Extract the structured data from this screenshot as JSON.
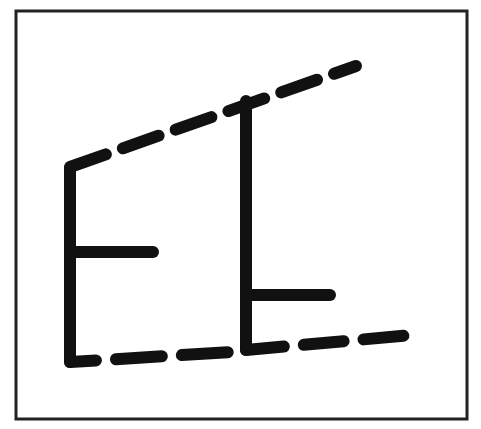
{
  "figure": {
    "colors": {
      "background": "#ffffff",
      "stroke": "#111111",
      "frame": "#222222"
    },
    "frame": {
      "x": 16,
      "y": 11,
      "width": 451,
      "height": 408,
      "stroke_width": 3
    },
    "stroke_width": 12,
    "dash_pattern": "38 18",
    "shapes": {
      "top_dashed_line": {
        "x1": 70,
        "y1": 167,
        "x2": 356,
        "y2": 66
      },
      "left_e": {
        "vertical": {
          "x": 70,
          "y1": 170,
          "y2": 362
        },
        "middle_bar": {
          "x1": 70,
          "x2": 153,
          "y": 252
        },
        "bottom_dashed": {
          "x1": 70,
          "y1": 362,
          "x2": 232,
          "y2": 352
        }
      },
      "right_e": {
        "vertical": {
          "x": 246,
          "y1": 100,
          "y2": 350
        },
        "middle_bar": {
          "x1": 246,
          "x2": 330,
          "y": 295
        },
        "bottom_dashed": {
          "x1": 246,
          "y1": 350,
          "x2": 412,
          "y2": 335
        }
      }
    }
  }
}
